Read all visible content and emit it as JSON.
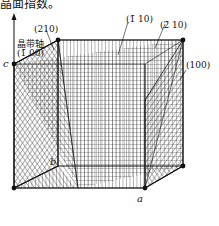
{
  "caption_fragment": "晶面指数。",
  "labels": {
    "plane_210": "(210)",
    "zone_axis": "晶带轴",
    "plane_bar100": "(1̄ 00)",
    "plane_bar110": "(1̄ 10)",
    "plane_bar210": "(2̄ 10)",
    "plane_100": "(100)"
  },
  "axes": {
    "a": "a",
    "b": "b",
    "c": "c"
  }
}
